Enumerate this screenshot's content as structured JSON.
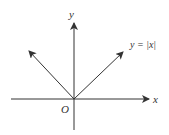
{
  "diagram": {
    "colors": {
      "stroke": "#333333",
      "text": "#333333",
      "background": "#ffffff"
    },
    "origin": {
      "x": 74,
      "y": 99
    },
    "axes": {
      "x": {
        "label": "x",
        "from": [
          11,
          99
        ],
        "to": [
          149,
          99
        ]
      },
      "y": {
        "label": "y",
        "from": [
          74,
          130
        ],
        "to": [
          74,
          23
        ]
      }
    },
    "origin_label": "O",
    "function": {
      "label": "y = |x|",
      "left_ray_tip": [
        29,
        51
      ],
      "right_ray_tip": [
        123,
        52
      ]
    }
  }
}
